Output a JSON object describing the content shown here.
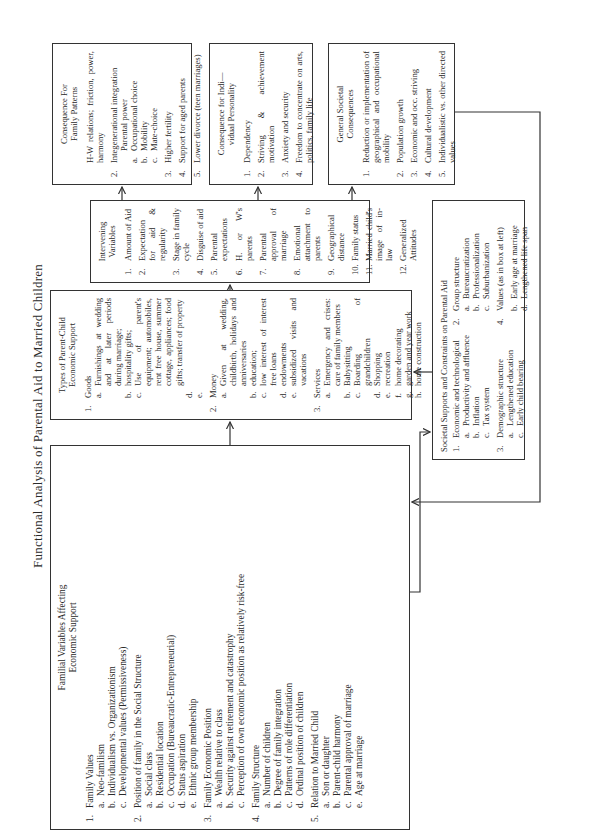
{
  "title": "Functional Analysis of Parental Aid to Married Children",
  "familial": {
    "heading": [
      "Familial Variables Affecting",
      "Economic Support"
    ],
    "items": [
      {
        "num": "1.",
        "label": "Family Values",
        "subs": [
          {
            "num": "a.",
            "label": "Neo-familism"
          },
          {
            "num": "b.",
            "label": "Individualism vs. Organizationism"
          },
          {
            "num": "c.",
            "label": "Developmental values (Permissiveness)"
          }
        ]
      },
      {
        "num": "2.",
        "label": "Position of family in the Social Structure",
        "subs": [
          {
            "num": "a.",
            "label": "Social class"
          },
          {
            "num": "b.",
            "label": "Residential location"
          },
          {
            "num": "c.",
            "label": "Occupation (Bureaucratic-Entrepreneurial)"
          },
          {
            "num": "d.",
            "label": "Status aspiration"
          },
          {
            "num": "e.",
            "label": "Ethnic group membership"
          }
        ]
      },
      {
        "num": "3.",
        "label": "Family Economic Position",
        "subs": [
          {
            "num": "a.",
            "label": "Wealth relative to class"
          },
          {
            "num": "b.",
            "label": "Security against retirement and catastrophy"
          },
          {
            "num": "c.",
            "label": "Perception of own economic position as relatively risk-free"
          }
        ]
      },
      {
        "num": "4.",
        "label": "Family Structure",
        "subs": [
          {
            "num": "a.",
            "label": "Number of children"
          },
          {
            "num": "b.",
            "label": "Degree of family integration"
          },
          {
            "num": "c.",
            "label": "Patterns of role differentiation"
          },
          {
            "num": "d.",
            "label": "Ordinal position of children"
          }
        ]
      },
      {
        "num": "5.",
        "label": "Relation to Married Child",
        "subs": [
          {
            "num": "a.",
            "label": "Son or daughter"
          },
          {
            "num": "b.",
            "label": "Parent-child harmony"
          },
          {
            "num": "c.",
            "label": "Parental approval of marriage"
          },
          {
            "num": "e.",
            "label": "Age at marriage"
          }
        ]
      }
    ]
  },
  "types": {
    "heading": [
      "Types of Parent-Child",
      "Economic Support"
    ],
    "items": [
      {
        "num": "1.",
        "label": "Goods",
        "subs": [
          {
            "num": "a.",
            "label": "Furnishings at wedding and at later periods during marriage;"
          },
          {
            "num": "b.",
            "label": "hospitality gifts;"
          },
          {
            "num": "c.",
            "label": "Use of parent's equipment; automobiles, rent free house, summer cottage, appliances; food gifts; transfer of property"
          },
          {
            "num": "d.",
            "label": ""
          },
          {
            "num": "e.",
            "label": ""
          }
        ]
      },
      {
        "num": "2.",
        "label": "Money",
        "subs": [
          {
            "num": "a.",
            "label": "Given at wedding, childbirth, holidays and anniversaries"
          },
          {
            "num": "b.",
            "label": "education;"
          },
          {
            "num": "c.",
            "label": "low interest of interest free loans"
          },
          {
            "num": "d.",
            "label": "endowments"
          },
          {
            "num": "e.",
            "label": "subsidized visits and vacations"
          }
        ]
      },
      {
        "num": "3.",
        "label": "Services",
        "subs": [
          {
            "num": "a.",
            "label": "Emergency and crises: care of family members"
          },
          {
            "num": "b.",
            "label": "Babysitting"
          },
          {
            "num": "c.",
            "label": "Boarding of grandchildren"
          },
          {
            "num": "d.",
            "label": "Shopping"
          },
          {
            "num": "e.",
            "label": "recreation"
          },
          {
            "num": "f.",
            "label": "home decorating"
          },
          {
            "num": "g.",
            "label": "garden and year work"
          },
          {
            "num": "h.",
            "label": "home construction"
          }
        ]
      }
    ]
  },
  "intervening": {
    "heading": [
      "Intervening",
      "Variables"
    ],
    "items": [
      {
        "num": "1.",
        "label": "Amount of Aid"
      },
      {
        "num": "2.",
        "label": "Expectation for aid & regularity"
      },
      {
        "num": "3.",
        "label": "Stage in family cycle"
      },
      {
        "num": "4.",
        "label": "Disguise of aid"
      },
      {
        "num": "5.",
        "label": "Parental expectations"
      },
      {
        "num": "6.",
        "label": "H. or W's parents"
      },
      {
        "num": "7.",
        "label": "Parental approval of marriage"
      },
      {
        "num": "8.",
        "label": "Emotional attachment to parents"
      },
      {
        "num": "9.",
        "label": "Geographical distance"
      },
      {
        "num": "10.",
        "label": "Family status"
      },
      {
        "num": "11.",
        "label": "Married child's image of in-law"
      },
      {
        "num": "12.",
        "label": "Generalized Attitudes"
      }
    ]
  },
  "family_patterns": {
    "heading": [
      "Consequence For",
      "Family Patterns"
    ],
    "items": [
      {
        "num": "",
        "label": "H-W relations; friction, power, harmony"
      },
      {
        "num": "2.",
        "label": "Integenerational integration",
        "subs": [
          {
            "num": "",
            "label": "Parental power"
          },
          {
            "num": "a.",
            "label": "Occupational choice"
          },
          {
            "num": "b.",
            "label": "Mobility"
          },
          {
            "num": "c.",
            "label": "Mate-choice"
          }
        ]
      },
      {
        "num": "3.",
        "label": "Higher fertility"
      },
      {
        "num": "4.",
        "label": "Support for aged parents"
      },
      {
        "num": "5.",
        "label": "Lower divorce (teen marriages)"
      }
    ]
  },
  "individual": {
    "heading": [
      "Consequence for Indi—",
      "vidual Personality"
    ],
    "items": [
      {
        "num": "1.",
        "label": "Dependency"
      },
      {
        "num": "2.",
        "label": "Striving & achievement motivation"
      },
      {
        "num": "3.",
        "label": "Anxiety and security"
      },
      {
        "num": "4.",
        "label": "Freedom to concentrate on arts, politics, family life"
      }
    ]
  },
  "societal_consequences": {
    "heading": [
      "General Societal",
      "Consequences"
    ],
    "items": [
      {
        "num": "1.",
        "label": "Reduction or implementation of geographical and occupational mobility"
      },
      {
        "num": "2.",
        "label": "Population growth"
      },
      {
        "num": "3.",
        "label": "Economic and occ. striving"
      },
      {
        "num": "4.",
        "label": "Cultural development"
      },
      {
        "num": "5.",
        "label": "Individualistic vs. other directed values"
      }
    ]
  },
  "societal_supports": {
    "heading": "Societal Supports and Constraints on Parental Aid",
    "left": [
      {
        "num": "1.",
        "label": "Economic and technological",
        "subs": [
          {
            "num": "a.",
            "label": "Productivity and affluence"
          },
          {
            "num": "b.",
            "label": "Inflation"
          },
          {
            "num": "c.",
            "label": "Tax system"
          }
        ]
      },
      {
        "num": "3.",
        "label": "Demographic structure",
        "subs": [
          {
            "num": "a.",
            "label": "Lengthened education"
          },
          {
            "num": "c.",
            "label": "Early child bearing"
          }
        ]
      }
    ],
    "right": [
      {
        "num": "2.",
        "label": "Group structure",
        "subs": [
          {
            "num": "a.",
            "label": "Bureaucratization"
          },
          {
            "num": "b.",
            "label": "Professionalization"
          },
          {
            "num": "c.",
            "label": "Suburbanization"
          }
        ]
      },
      {
        "num": "4.",
        "label": "Values (as in box at left)"
      },
      {
        "num": "",
        "label": "",
        "subs": [
          {
            "num": "b.",
            "label": "Early age at marriage"
          },
          {
            "num": "d.",
            "label": "Lengthened life span"
          }
        ]
      }
    ]
  },
  "colors": {
    "ink": "#2a2a2a",
    "line": "#333333",
    "paper": "#ffffff"
  }
}
